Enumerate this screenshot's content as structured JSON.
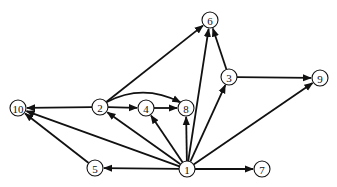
{
  "diagram": {
    "type": "directed-graph",
    "nodes": [
      {
        "id": "1",
        "label": "1"
      },
      {
        "id": "2",
        "label": "2"
      },
      {
        "id": "3",
        "label": "3"
      },
      {
        "id": "4",
        "label": "4"
      },
      {
        "id": "5",
        "label": "5"
      },
      {
        "id": "6",
        "label": "6"
      },
      {
        "id": "7",
        "label": "7"
      },
      {
        "id": "8",
        "label": "8"
      },
      {
        "id": "9",
        "label": "9"
      },
      {
        "id": "10",
        "label": "10"
      }
    ],
    "edges": [
      {
        "from": "1",
        "to": "2"
      },
      {
        "from": "1",
        "to": "3"
      },
      {
        "from": "1",
        "to": "4"
      },
      {
        "from": "1",
        "to": "5"
      },
      {
        "from": "1",
        "to": "6"
      },
      {
        "from": "1",
        "to": "7"
      },
      {
        "from": "1",
        "to": "8"
      },
      {
        "from": "1",
        "to": "9"
      },
      {
        "from": "1",
        "to": "10"
      },
      {
        "from": "2",
        "to": "4"
      },
      {
        "from": "2",
        "to": "6"
      },
      {
        "from": "2",
        "to": "8",
        "curved": true
      },
      {
        "from": "2",
        "to": "10"
      },
      {
        "from": "3",
        "to": "6"
      },
      {
        "from": "3",
        "to": "9"
      },
      {
        "from": "4",
        "to": "8"
      },
      {
        "from": "5",
        "to": "10"
      }
    ]
  }
}
